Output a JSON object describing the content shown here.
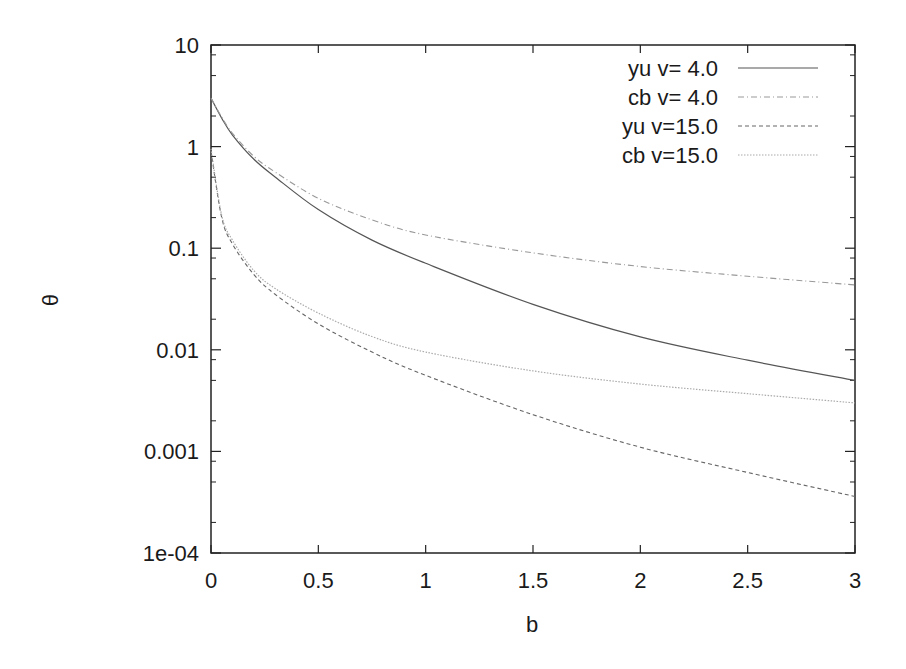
{
  "chart_data": {
    "type": "line",
    "title": "",
    "xlabel": "b",
    "ylabel": "θ",
    "xscale": "linear",
    "yscale": "log",
    "xlim": [
      0,
      3
    ],
    "ylim": [
      0.0001,
      10
    ],
    "grid": false,
    "legend_position": "top-right",
    "x_ticks": [
      "0",
      "0.5",
      "1",
      "1.5",
      "2",
      "2.5",
      "3"
    ],
    "y_ticks": [
      "1e-04",
      "0.001",
      "0.01",
      "0.1",
      "1",
      "10"
    ],
    "x": [
      0.0,
      0.05,
      0.1,
      0.2,
      0.3,
      0.5,
      0.75,
      1.0,
      1.5,
      2.0,
      2.5,
      3.0
    ],
    "series": [
      {
        "name": "yu v= 4.0",
        "style": "solid",
        "values": [
          3.0,
          1.9,
          1.3,
          0.75,
          0.5,
          0.24,
          0.12,
          0.071,
          0.028,
          0.0134,
          0.0079,
          0.005
        ]
      },
      {
        "name": "cb v= 4.0",
        "style": "dash-dot",
        "values": [
          3.0,
          1.95,
          1.35,
          0.8,
          0.56,
          0.31,
          0.19,
          0.135,
          0.09,
          0.066,
          0.053,
          0.0435
        ]
      },
      {
        "name": "yu v=15.0",
        "style": "dashed",
        "values": [
          0.9,
          0.2,
          0.11,
          0.055,
          0.035,
          0.018,
          0.0095,
          0.0056,
          0.0023,
          0.0011,
          0.00062,
          0.00036
        ]
      },
      {
        "name": "cb v=15.0",
        "style": "dotted",
        "values": [
          0.95,
          0.21,
          0.12,
          0.06,
          0.04,
          0.023,
          0.0135,
          0.0095,
          0.0062,
          0.0046,
          0.0037,
          0.003
        ]
      }
    ]
  }
}
